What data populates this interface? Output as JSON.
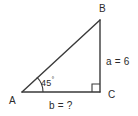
{
  "figure": {
    "type": "geometry-diagram",
    "shape": "right-triangle",
    "background_color": "#ffffff",
    "stroke_color": "#3a3a3a",
    "text_color": "#2b2b2b",
    "vertices": {
      "a": "A",
      "b": "B",
      "c": "C"
    },
    "angles": {
      "at_a_value": "45",
      "at_a_degree_symbol": "°",
      "at_c_marker": "right-angle-square"
    },
    "sides": {
      "vertical_leg_label": "a = 6",
      "horizontal_leg_label": "b = ?"
    }
  }
}
